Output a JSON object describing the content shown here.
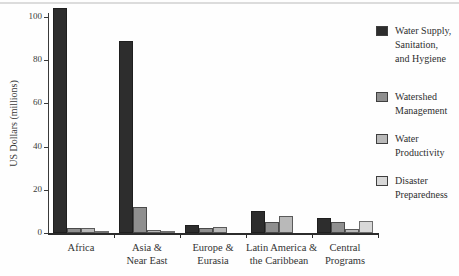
{
  "figure": {
    "ylabel": "US Dollars (millions)"
  },
  "chart_data": {
    "type": "bar",
    "title": "",
    "xlabel": "",
    "ylabel": "US Dollars (millions)",
    "ylim": [
      0,
      100
    ],
    "yticks": [
      0,
      20,
      40,
      60,
      80,
      100
    ],
    "grid": false,
    "legend_position": "right",
    "categories": [
      "Africa",
      "Asia & Near East",
      "Europe & Eurasia",
      "Latin America & the Caribbean",
      "Central Programs"
    ],
    "category_label_lines": [
      [
        "Africa"
      ],
      [
        "Asia &",
        "Near East"
      ],
      [
        "Europe &",
        "Eurasia"
      ],
      [
        "Latin America &",
        "the Caribbean"
      ],
      [
        "Central",
        "Programs"
      ]
    ],
    "series": [
      {
        "name": "Water Supply, Sanitation, and Hygiene",
        "legend_lines": [
          "Water Supply,",
          "Sanitation,",
          "and Hygiene"
        ],
        "color": "#2d2d2d",
        "border": "#1f1f1f",
        "values": [
          104,
          89,
          3.5,
          10,
          7
        ]
      },
      {
        "name": "Watershed Management",
        "legend_lines": [
          "Watershed",
          "Management"
        ],
        "color": "#8f8f8f",
        "border": "#4a4a4a",
        "values": [
          2.5,
          12,
          2.5,
          5,
          5
        ]
      },
      {
        "name": "Water Productivity",
        "legend_lines": [
          "Water",
          "Productivity"
        ],
        "color": "#b9b9b9",
        "border": "#5a5a5a",
        "values": [
          2.5,
          1.5,
          3,
          8,
          2
        ]
      },
      {
        "name": "Disaster Preparedness",
        "legend_lines": [
          "Disaster",
          "Preparedness"
        ],
        "color": "#d8d8d8",
        "border": "#6e6e6e",
        "values": [
          1,
          0.5,
          0,
          0,
          5.5
        ]
      }
    ]
  }
}
